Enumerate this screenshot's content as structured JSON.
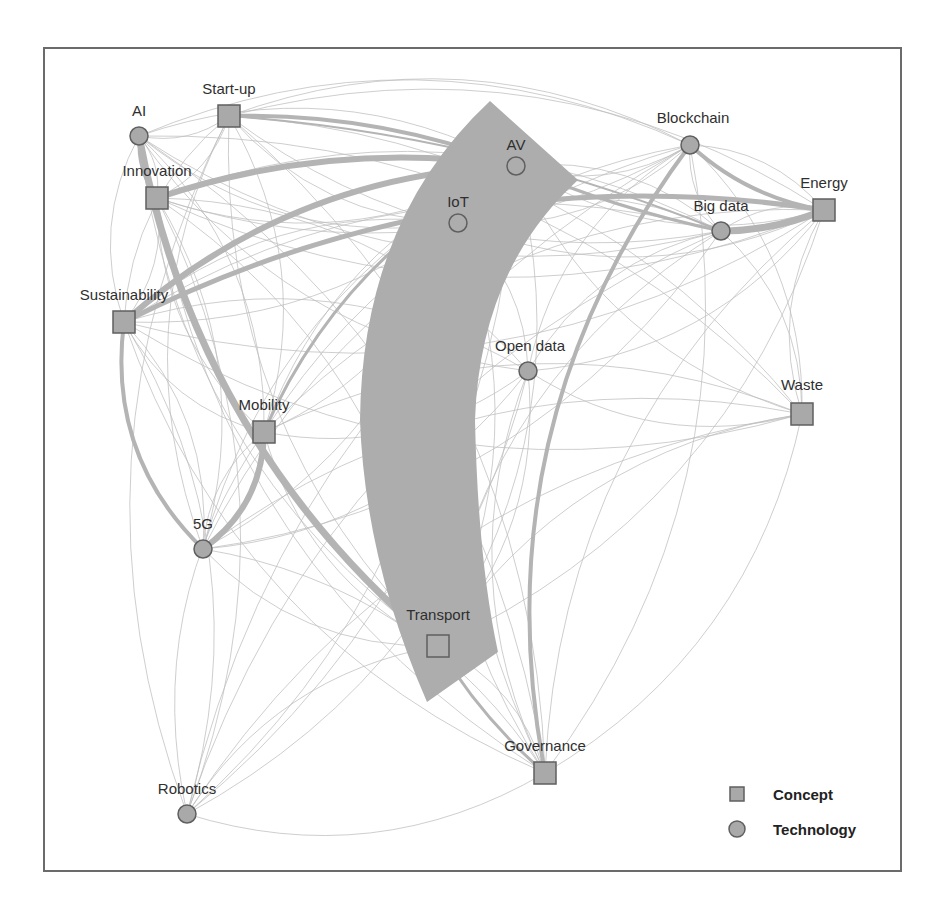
{
  "chart_data": {
    "type": "network",
    "title": "",
    "legend": {
      "position": "bottom-right",
      "entries": [
        {
          "label": "Concept",
          "shape": "square"
        },
        {
          "label": "Technology",
          "shape": "circle"
        }
      ]
    },
    "colors": {
      "node_fill": "#a9a9a9",
      "node_stroke": "#5f5f5f",
      "edge": "#bdbdbd",
      "edge_strong": "#b4b4b4",
      "frame": "#6b6b6b",
      "label": "#2f2f2f"
    },
    "nodes": [
      {
        "id": "AI",
        "label": "AI",
        "type": "Technology",
        "x": 139,
        "y": 136
      },
      {
        "id": "Start-up",
        "label": "Start-up",
        "type": "Concept",
        "x": 229,
        "y": 116
      },
      {
        "id": "Innovation",
        "label": "Innovation",
        "type": "Concept",
        "x": 157,
        "y": 198
      },
      {
        "id": "Sustainability",
        "label": "Sustainability",
        "type": "Concept",
        "x": 124,
        "y": 322
      },
      {
        "id": "Mobility",
        "label": "Mobility",
        "type": "Concept",
        "x": 264,
        "y": 432
      },
      {
        "id": "5G",
        "label": "5G",
        "type": "Technology",
        "x": 203,
        "y": 549
      },
      {
        "id": "AV",
        "label": "AV",
        "type": "Technology",
        "x": 516,
        "y": 166
      },
      {
        "id": "IoT",
        "label": "IoT",
        "type": "Technology",
        "x": 458,
        "y": 223
      },
      {
        "id": "Blockchain",
        "label": "Blockchain",
        "type": "Technology",
        "x": 690,
        "y": 145
      },
      {
        "id": "Big data",
        "label": "Big data",
        "type": "Technology",
        "x": 721,
        "y": 231
      },
      {
        "id": "Energy",
        "label": "Energy",
        "type": "Concept",
        "x": 824,
        "y": 210
      },
      {
        "id": "Open data",
        "label": "Open data",
        "type": "Technology",
        "x": 528,
        "y": 371
      },
      {
        "id": "Waste",
        "label": "Waste",
        "type": "Concept",
        "x": 802,
        "y": 414
      },
      {
        "id": "Transport",
        "label": "Transport",
        "type": "Concept",
        "x": 438,
        "y": 646
      },
      {
        "id": "Governance",
        "label": "Governance",
        "type": "Concept",
        "x": 545,
        "y": 773
      },
      {
        "id": "Robotics",
        "label": "Robotics",
        "type": "Technology",
        "x": 187,
        "y": 814
      }
    ],
    "edges_strong": [
      {
        "source": "IoT",
        "target": "Transport",
        "weight": 90
      },
      {
        "source": "AI",
        "target": "Transport",
        "weight": 7
      },
      {
        "source": "Innovation",
        "target": "AV",
        "weight": 6
      },
      {
        "source": "Sustainability",
        "target": "AV",
        "weight": 6
      },
      {
        "source": "Sustainability",
        "target": "Energy",
        "weight": 5
      },
      {
        "source": "Start-up",
        "target": "AV",
        "weight": 4
      },
      {
        "source": "Big data",
        "target": "Energy",
        "weight": 7
      },
      {
        "source": "Blockchain",
        "target": "Energy",
        "weight": 4
      },
      {
        "source": "Blockchain",
        "target": "Governance",
        "weight": 4
      },
      {
        "source": "AV",
        "target": "Big data",
        "weight": 3
      },
      {
        "source": "Sustainability",
        "target": "5G",
        "weight": 4
      },
      {
        "source": "Mobility",
        "target": "5G",
        "weight": 6
      },
      {
        "source": "Mobility",
        "target": "AV",
        "weight": 3
      },
      {
        "source": "Transport",
        "target": "Governance",
        "weight": 3
      },
      {
        "source": "AI",
        "target": "Innovation",
        "weight": 2
      },
      {
        "source": "Start-up",
        "target": "Big data",
        "weight": 2
      }
    ],
    "edges_weak_count_estimate": 120
  },
  "legend": {
    "concept_label": "Concept",
    "technology_label": "Technology"
  }
}
